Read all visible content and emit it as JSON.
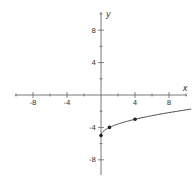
{
  "chart_data": {
    "type": "line",
    "title": "",
    "function": "y = sqrt(x) - 5",
    "xlabel": "x",
    "ylabel": "y",
    "xlim": [
      -10.5,
      10.6
    ],
    "ylim": [
      -10,
      10
    ],
    "x_ticks_labeled": [
      -8,
      -4,
      4,
      8
    ],
    "y_ticks_labeled": [
      8,
      4,
      -4,
      -8
    ],
    "minor_tick_step": 2,
    "grid": false,
    "legend": null,
    "series": [
      {
        "name": "curve",
        "x": [
          0,
          0.25,
          0.5,
          1,
          2,
          3,
          4,
          5,
          6,
          7,
          8,
          9,
          10,
          10.6
        ],
        "y": [
          -5,
          -4.5,
          -4.29,
          -4,
          -3.59,
          -3.27,
          -3,
          -2.76,
          -2.55,
          -2.35,
          -2.17,
          -2,
          -1.84,
          -1.74
        ]
      }
    ],
    "points": [
      {
        "x": 0,
        "y": -5
      },
      {
        "x": 1,
        "y": -4
      },
      {
        "x": 4,
        "y": -3
      }
    ]
  },
  "colors": {
    "axis": "#555555",
    "curve": "#444444",
    "point": "#222222"
  }
}
